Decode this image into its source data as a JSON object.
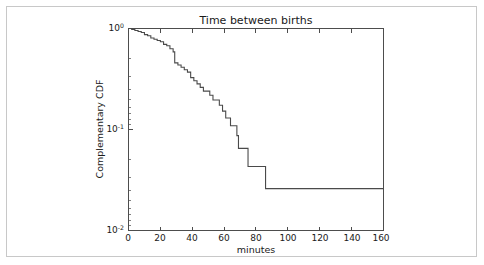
{
  "figure": {
    "background_color": "#ffffff",
    "frame_color": "#c8c8c8",
    "line_color": "#4a4a4a",
    "axis_color": "#4d4d4d"
  },
  "chart_data": {
    "type": "line",
    "title": "Time between births",
    "xlabel": "minutes",
    "ylabel": "Complementary CDF",
    "xlim": [
      0,
      160
    ],
    "ylim": [
      0.01,
      1
    ],
    "yscale": "log",
    "xscale": "linear",
    "grid": false,
    "legend": null,
    "drawstyle": "steps-post",
    "xticks": [
      0,
      20,
      40,
      60,
      80,
      100,
      120,
      140,
      160
    ],
    "xtick_labels": [
      "0",
      "20",
      "40",
      "60",
      "80",
      "100",
      "120",
      "140",
      "160"
    ],
    "yticks": [
      1,
      0.1,
      0.01
    ],
    "ytick_labels": [
      "10^0",
      "10^-1",
      "10^-2"
    ],
    "ytick_label_parts": [
      {
        "base": "10",
        "exp": "0"
      },
      {
        "base": "10",
        "exp": "-1"
      },
      {
        "base": "10",
        "exp": "-2"
      }
    ],
    "series": [
      {
        "name": "Complementary CDF of time between births",
        "x": [
          0,
          2,
          4,
          6,
          8,
          10,
          12,
          14,
          16,
          18,
          20,
          22,
          24,
          26,
          28,
          29,
          31,
          33,
          35,
          37,
          39,
          41,
          43,
          45,
          47,
          49,
          51,
          53,
          55,
          57,
          59,
          61,
          62,
          64,
          66,
          68,
          69,
          71,
          73,
          75,
          77,
          80,
          83,
          86,
          160
        ],
        "y": [
          1.0,
          0.978,
          0.957,
          0.935,
          0.913,
          0.87,
          0.848,
          0.804,
          0.783,
          0.761,
          0.739,
          0.696,
          0.674,
          0.63,
          0.587,
          0.457,
          0.435,
          0.413,
          0.391,
          0.37,
          0.326,
          0.304,
          0.283,
          0.261,
          0.24,
          0.24,
          0.218,
          0.196,
          0.196,
          0.174,
          0.152,
          0.13,
          0.13,
          0.109,
          0.109,
          0.087,
          0.065,
          0.065,
          0.065,
          0.043,
          0.043,
          0.043,
          0.043,
          0.026,
          0.026
        ]
      }
    ],
    "annotations": [],
    "tail_value": 0.026,
    "tail_start_minutes": 86
  }
}
